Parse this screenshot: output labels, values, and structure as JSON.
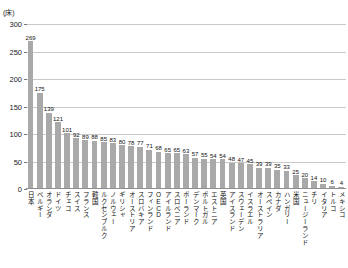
{
  "chart_data": {
    "type": "bar",
    "title": "",
    "subtitle": "",
    "unit_label": "(床)",
    "xlabel": "",
    "ylabel": "",
    "ylim": [
      0,
      300
    ],
    "yticks": [
      0,
      50,
      100,
      150,
      200,
      250,
      300
    ],
    "grid": true,
    "legend": false,
    "bar_color": "#a9a9a9",
    "gridline_color": "#c9c9c9",
    "categories": [
      "日本",
      "ベルギー",
      "オランダ",
      "ドイツ",
      "チェコ",
      "スイス",
      "フランス",
      "韓国",
      "ルクセンブルク",
      "ノルウェー",
      "ギリシャ",
      "オーストリア",
      "スロバキア",
      "フィンランド",
      "OECD",
      "アイルランド",
      "スロベニア",
      "ポーランド",
      "デンマーク",
      "ポルトガル",
      "エストニア",
      "英国",
      "アイスランド",
      "スウェーデン",
      "イスラエル",
      "オーストラリア",
      "スペイン",
      "カナダ",
      "ハンガリー",
      "米国",
      "ニュージーランド",
      "チリ",
      "イタリア",
      "トルコ",
      "メキシコ"
    ],
    "values": [
      269,
      175,
      139,
      121,
      101,
      92,
      89,
      88,
      85,
      83,
      80,
      78,
      77,
      71,
      68,
      65,
      65,
      63,
      57,
      55,
      54,
      54,
      48,
      47,
      45,
      39,
      39,
      35,
      33,
      25,
      20,
      14,
      10,
      6,
      4
    ]
  }
}
